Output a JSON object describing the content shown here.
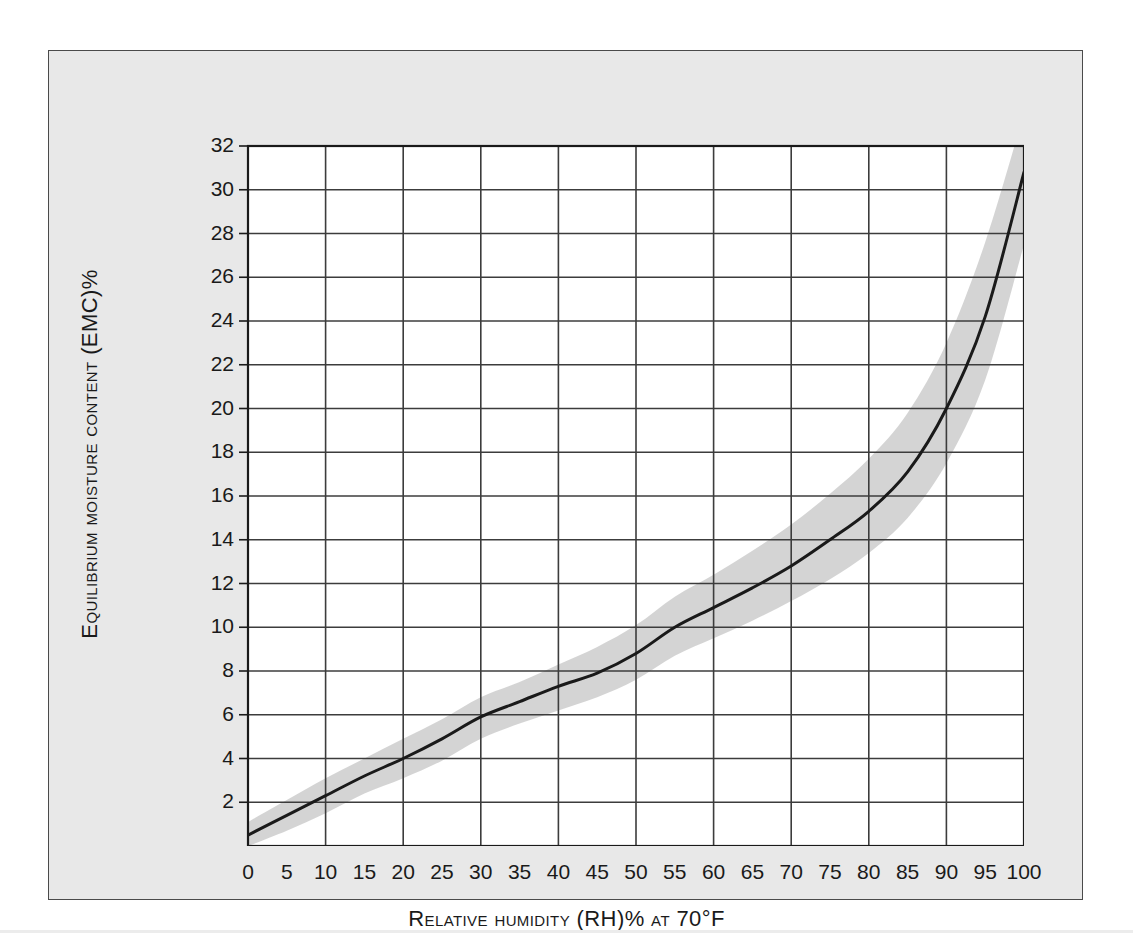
{
  "chart_data": {
    "type": "line",
    "title": "",
    "xlabel": "Relative humidity (RH)% at 70°F",
    "ylabel": "Equilibrium moisture content (EMC)%",
    "xlim": [
      0,
      100
    ],
    "ylim": [
      0,
      32
    ],
    "grid": true,
    "legend": "none",
    "x_tick_labels": [
      "0",
      "5",
      "10",
      "15",
      "20",
      "25",
      "30",
      "35",
      "40",
      "45",
      "50",
      "55",
      "60",
      "65",
      "70",
      "75",
      "80",
      "85",
      "90",
      "95",
      "100"
    ],
    "y_tick_labels": [
      "2",
      "4",
      "6",
      "8",
      "10",
      "12",
      "14",
      "16",
      "18",
      "20",
      "22",
      "24",
      "26",
      "28",
      "30",
      "32"
    ],
    "x_major_gridlines": [
      10,
      20,
      30,
      40,
      50,
      60,
      70,
      80,
      90
    ],
    "y_major_gridlines": [
      2,
      4,
      6,
      8,
      10,
      12,
      14,
      16,
      18,
      20,
      22,
      24,
      26,
      28,
      30
    ],
    "series": [
      {
        "name": "Equilibrium moisture content",
        "style": "solid-black-line",
        "color": "#1a1a1a",
        "x": [
          0,
          5,
          10,
          15,
          20,
          25,
          30,
          35,
          40,
          45,
          50,
          55,
          60,
          65,
          70,
          75,
          80,
          85,
          90,
          95,
          100
        ],
        "values": [
          0.5,
          1.4,
          2.3,
          3.2,
          4.0,
          4.9,
          5.9,
          6.6,
          7.3,
          7.9,
          8.8,
          10.0,
          10.9,
          11.8,
          12.8,
          14.0,
          15.3,
          17.1,
          20.0,
          24.2,
          30.8
        ]
      },
      {
        "name": "Tolerance band upper",
        "style": "shaded-band",
        "color": "#d2d2d2",
        "x": [
          0,
          5,
          10,
          15,
          20,
          25,
          30,
          35,
          40,
          45,
          50,
          55,
          60,
          65,
          70,
          75,
          80,
          85,
          90,
          95,
          100
        ],
        "values": [
          1.1,
          2.1,
          3.1,
          4.0,
          4.9,
          5.8,
          6.8,
          7.5,
          8.3,
          9.1,
          10.1,
          11.4,
          12.4,
          13.5,
          14.7,
          16.1,
          17.7,
          19.8,
          23.0,
          27.6,
          33.5
        ]
      },
      {
        "name": "Tolerance band lower",
        "style": "shaded-band",
        "color": "#d2d2d2",
        "x": [
          0,
          5,
          10,
          15,
          20,
          25,
          30,
          35,
          40,
          45,
          50,
          55,
          60,
          65,
          70,
          75,
          80,
          85,
          90,
          95,
          100
        ],
        "values": [
          0.0,
          0.7,
          1.5,
          2.4,
          3.1,
          3.9,
          4.9,
          5.6,
          6.2,
          6.8,
          7.6,
          8.7,
          9.5,
          10.3,
          11.2,
          12.2,
          13.4,
          15.0,
          17.5,
          21.3,
          27.5
        ]
      }
    ]
  },
  "figure": {
    "background_color": "#e8e8e8",
    "plot_background_color": "#ffffff",
    "band_color": "#d2d2d2",
    "line_color": "#1a1a1a",
    "grid_color": "#3c3c3c"
  }
}
